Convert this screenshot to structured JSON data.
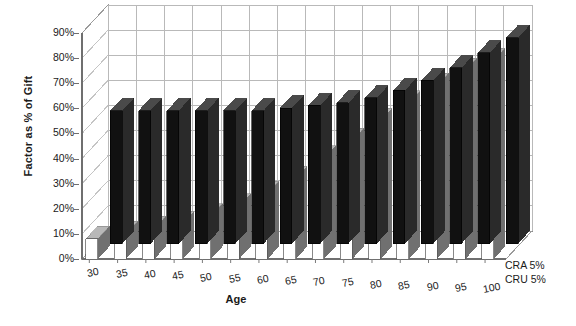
{
  "chart_data": {
    "type": "bar",
    "title": "",
    "subtitle": "",
    "xlabel": "Age",
    "ylabel": "Factor as % of Gift",
    "categories": [
      "30",
      "35",
      "40",
      "45",
      "50",
      "55",
      "60",
      "65",
      "70",
      "75",
      "80",
      "85",
      "90",
      "95",
      "100"
    ],
    "series": [
      {
        "name": "CRA 5%",
        "color": "#111111",
        "values": [
          53,
          53,
          53,
          53,
          53,
          53,
          54,
          55,
          56,
          58,
          61,
          65,
          70,
          76,
          82
        ]
      },
      {
        "name": "CRU 5%",
        "color": "#ffffff",
        "values": [
          8,
          10,
          12,
          14,
          17,
          21,
          26,
          32,
          40,
          47,
          55,
          62,
          69,
          75,
          79
        ]
      }
    ],
    "ylim": [
      0,
      90
    ],
    "ytick_step": 10,
    "ytick_labels": [
      "90%",
      "80%",
      "70%",
      "60%",
      "50%",
      "40%",
      "30%",
      "20%",
      "10%",
      "0%"
    ],
    "ytick_values": [
      90,
      80,
      70,
      60,
      50,
      40,
      30,
      20,
      10,
      0
    ],
    "grid": true,
    "grid_axis": "both",
    "legend_position": "right-bottom",
    "projection": "3d-bar",
    "value_unit": "%"
  },
  "axes": {
    "y_title": "Factor as % of Gift",
    "x_title": "Age"
  },
  "legend": {
    "entries": [
      {
        "label": "CRA 5%"
      },
      {
        "label": "CRU 5%"
      }
    ]
  }
}
